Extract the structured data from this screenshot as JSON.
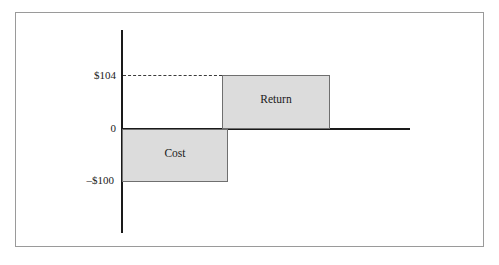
{
  "chart_data": {
    "type": "bar",
    "title": "",
    "subtitle": "",
    "xlabel": "",
    "ylabel": "",
    "categories": [
      "Cost",
      "Return"
    ],
    "values": [
      -100,
      104
    ],
    "value_labels": [
      "–$100",
      "$104"
    ],
    "ytick_labels": [
      "$104",
      "0",
      "–$100"
    ],
    "ytick_values": [
      104,
      0,
      -100
    ],
    "ylim": [
      -195,
      190
    ],
    "grid": false,
    "legend": false,
    "annotations": [
      {
        "name": "dashed-guide",
        "description": "dashed horizontal guide line from y-axis to top of Return bar at $104",
        "value": 104
      }
    ],
    "series": [
      {
        "name": "Cash flow",
        "points": [
          {
            "category": "Cost",
            "value": -100,
            "label": "Cost"
          },
          {
            "category": "Return",
            "value": 104,
            "label": "Return"
          }
        ]
      }
    ],
    "colors": {
      "bar_fill": "#dcdcdc",
      "bar_stroke": "#6f6f6f",
      "axis": "#1a1a1a",
      "frame": "#9a9a9a",
      "text": "#1a1a1a",
      "guide": "#3a3a3a"
    }
  },
  "axes": {
    "y_tick_upper": "$104",
    "y_tick_zero": "0",
    "y_tick_lower": "–$100"
  },
  "bars": {
    "cost_label": "Cost",
    "return_label": "Return"
  }
}
